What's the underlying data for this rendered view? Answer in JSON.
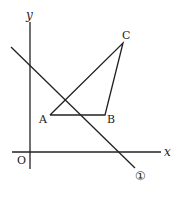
{
  "diagram": {
    "type": "coordinate-geometry",
    "axes": {
      "x_label": "x",
      "y_label": "y",
      "origin_label": "O"
    },
    "points": {
      "A": {
        "label": "A"
      },
      "B": {
        "label": "B"
      },
      "C": {
        "label": "C"
      }
    },
    "line": {
      "label": "①"
    }
  }
}
